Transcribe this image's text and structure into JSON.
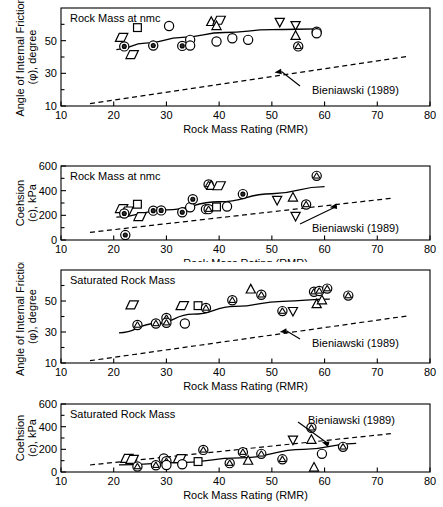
{
  "figure": {
    "width": 443,
    "height": 507,
    "background": "#ffffff",
    "ink": "#000000"
  },
  "common": {
    "xlabel": "Rock Mass Rating (RMR)",
    "xticks": [
      10,
      20,
      30,
      40,
      50,
      60,
      70,
      80
    ],
    "xlim": [
      10,
      80
    ],
    "reference_label": "Bieniawski (1989)"
  },
  "panels": [
    {
      "id": "panel-a",
      "title": "Rock Mass at nmc",
      "ylabel_line1": "Angle of Internal Friction",
      "ylabel_line2": "(φ), degree",
      "yticklabels": [
        "10",
        "30",
        "50"
      ],
      "ylim": [
        10,
        70
      ],
      "ymajor": [
        10,
        30,
        50
      ],
      "yminor": [
        20,
        40,
        60
      ]
    },
    {
      "id": "panel-b",
      "title": "Rock Mass at nmc",
      "ylabel_line1": "Coehsion",
      "ylabel_line2": "(c), kPa",
      "yticklabels": [
        "0",
        "200",
        "400",
        "600"
      ],
      "ylim": [
        0,
        600
      ],
      "ymajor": [
        0,
        200,
        400,
        600
      ],
      "yminor": [
        100,
        300,
        500
      ]
    },
    {
      "id": "panel-c",
      "title": "Saturated Rock Mass",
      "ylabel_line1": "Angle of Internal Friction",
      "ylabel_line2": "(φ), degree",
      "yticklabels": [
        "10",
        "30",
        "50"
      ],
      "ylim": [
        10,
        70
      ],
      "ymajor": [
        10,
        30,
        50
      ],
      "yminor": [
        20,
        40,
        60
      ]
    },
    {
      "id": "panel-d",
      "title": "Saturated Rock Mass",
      "ylabel_line1": "Coehsion",
      "ylabel_line2": "(c), kPa",
      "yticklabels": [
        "0",
        "200",
        "400",
        "600"
      ],
      "ylim": [
        0,
        600
      ],
      "ymajor": [
        0,
        200,
        400,
        600
      ],
      "yminor": [
        100,
        300,
        500
      ]
    }
  ],
  "chart_data": [
    {
      "type": "scatter",
      "id": "panel-a",
      "title": "Rock Mass at nmc",
      "xlabel": "Rock Mass Rating (RMR)",
      "ylabel": "Angle of Internal Friction (φ), degree",
      "xlim": [
        10,
        80
      ],
      "ylim": [
        10,
        70
      ],
      "grid": false,
      "legend": "none",
      "points": [
        {
          "x": 21.5,
          "y": 52.0,
          "marker": "parallelogram"
        },
        {
          "x": 22.0,
          "y": 46.5,
          "marker": "circle-dot"
        },
        {
          "x": 24.5,
          "y": 58.0,
          "marker": "square"
        },
        {
          "x": 23.5,
          "y": 41.5,
          "marker": "parallelogram"
        },
        {
          "x": 27.5,
          "y": 47.0,
          "marker": "circle-dot"
        },
        {
          "x": 30.5,
          "y": 59.0,
          "marker": "circle"
        },
        {
          "x": 33.0,
          "y": 46.8,
          "marker": "circle-dot"
        },
        {
          "x": 34.5,
          "y": 50.5,
          "marker": "circle"
        },
        {
          "x": 34.5,
          "y": 47.0,
          "marker": "circle"
        },
        {
          "x": 38.5,
          "y": 61.5,
          "marker": "triangle-up"
        },
        {
          "x": 40.0,
          "y": 62.5,
          "marker": "parallelogram"
        },
        {
          "x": 39.5,
          "y": 59.0,
          "marker": "triangle-up"
        },
        {
          "x": 39.5,
          "y": 49.5,
          "marker": "circle"
        },
        {
          "x": 42.5,
          "y": 51.5,
          "marker": "circle"
        },
        {
          "x": 45.5,
          "y": 50.5,
          "marker": "circle"
        },
        {
          "x": 51.5,
          "y": 61.5,
          "marker": "triangle-down"
        },
        {
          "x": 54.5,
          "y": 59.5,
          "marker": "triangle-down"
        },
        {
          "x": 54.5,
          "y": 53.0,
          "marker": "triangle-up"
        },
        {
          "x": 55.0,
          "y": 46.5,
          "marker": "circle-hatch"
        },
        {
          "x": 58.5,
          "y": 55.5,
          "marker": "circle-hatch"
        },
        {
          "x": 58.5,
          "y": 54.5,
          "marker": "circle"
        }
      ],
      "fit_line": {
        "label": "rock mass fit",
        "style": "solid",
        "points": [
          [
            20.5,
            44.5
          ],
          [
            26,
            48.5
          ],
          [
            33,
            52
          ],
          [
            41,
            55
          ],
          [
            50,
            56.8
          ],
          [
            59,
            57.2
          ]
        ]
      },
      "reference_line": {
        "label": "Bieniawski (1989)",
        "style": "dashed",
        "points": [
          [
            15.5,
            11.5
          ],
          [
            76.0,
            40.5
          ]
        ]
      },
      "annotation": {
        "text": "Bieniawski (1989)",
        "arrow_target_x": 50.5,
        "arrow_target_y": 30.5
      }
    },
    {
      "type": "scatter",
      "id": "panel-b",
      "title": "Rock Mass at nmc",
      "xlabel": "Rock Mass Rating (RMR)",
      "ylabel": "Coehsion (c), kPa",
      "xlim": [
        10,
        80
      ],
      "ylim": [
        0,
        600
      ],
      "grid": false,
      "legend": "none",
      "points": [
        {
          "x": 21.5,
          "y": 255,
          "marker": "parallelogram"
        },
        {
          "x": 22.5,
          "y": 235,
          "marker": "parallelogram"
        },
        {
          "x": 22.0,
          "y": 215,
          "marker": "circle-dot"
        },
        {
          "x": 22.2,
          "y": 40,
          "marker": "circle-dot"
        },
        {
          "x": 24.5,
          "y": 290,
          "marker": "square"
        },
        {
          "x": 25.0,
          "y": 190,
          "marker": "parallelogram"
        },
        {
          "x": 27.5,
          "y": 238,
          "marker": "circle-dot"
        },
        {
          "x": 29.0,
          "y": 240,
          "marker": "circle-dot"
        },
        {
          "x": 33.0,
          "y": 225,
          "marker": "circle-dot"
        },
        {
          "x": 34.5,
          "y": 265,
          "marker": "circle"
        },
        {
          "x": 35.0,
          "y": 330,
          "marker": "circle-dot"
        },
        {
          "x": 37.5,
          "y": 250,
          "marker": "circle"
        },
        {
          "x": 38.0,
          "y": 450,
          "marker": "circle-hatch"
        },
        {
          "x": 38.5,
          "y": 440,
          "marker": "triangle-up"
        },
        {
          "x": 40.0,
          "y": 440,
          "marker": "parallelogram"
        },
        {
          "x": 38.0,
          "y": 250,
          "marker": "circle-hatch"
        },
        {
          "x": 39.5,
          "y": 268,
          "marker": "square"
        },
        {
          "x": 41.5,
          "y": 272,
          "marker": "circle"
        },
        {
          "x": 44.5,
          "y": 372,
          "marker": "circle-dot"
        },
        {
          "x": 51.0,
          "y": 325,
          "marker": "triangle-down"
        },
        {
          "x": 54.0,
          "y": 345,
          "marker": "triangle-up"
        },
        {
          "x": 54.5,
          "y": 195,
          "marker": "triangle-down"
        },
        {
          "x": 56.5,
          "y": 288,
          "marker": "circle-hatch"
        },
        {
          "x": 58.5,
          "y": 520,
          "marker": "circle-hatch"
        }
      ],
      "fit_line": {
        "label": "rock mass fit",
        "style": "solid",
        "points": [
          [
            20.5,
            185
          ],
          [
            30,
            245
          ],
          [
            40,
            310
          ],
          [
            50,
            375
          ],
          [
            60,
            432
          ]
        ]
      },
      "reference_line": {
        "label": "Bieniawski (1989)",
        "style": "dashed",
        "points": [
          [
            15.5,
            62
          ],
          [
            73.0,
            340
          ]
        ]
      },
      "annotation": {
        "text": "Bieniawski (1989)",
        "arrow_target_x": 61.0,
        "arrow_target_y": 265
      }
    },
    {
      "type": "scatter",
      "id": "panel-c",
      "title": "Saturated Rock Mass",
      "xlabel": "Rock Mass Rating (RMR)",
      "ylabel": "Angle of Internal Friction (φ), degree",
      "xlim": [
        10,
        80
      ],
      "ylim": [
        10,
        70
      ],
      "grid": false,
      "legend": "none",
      "points": [
        {
          "x": 23.5,
          "y": 47.5,
          "marker": "parallelogram"
        },
        {
          "x": 24.5,
          "y": 34.5,
          "marker": "circle-hatch"
        },
        {
          "x": 28.0,
          "y": 35.5,
          "marker": "circle-hatch"
        },
        {
          "x": 30.0,
          "y": 39.0,
          "marker": "circle-hatch"
        },
        {
          "x": 30.0,
          "y": 36.0,
          "marker": "circle-hatch"
        },
        {
          "x": 33.0,
          "y": 47.0,
          "marker": "parallelogram"
        },
        {
          "x": 33.5,
          "y": 35.5,
          "marker": "circle"
        },
        {
          "x": 36.0,
          "y": 47.0,
          "marker": "square"
        },
        {
          "x": 37.5,
          "y": 45.5,
          "marker": "circle-hatch"
        },
        {
          "x": 42.5,
          "y": 50.5,
          "marker": "circle-hatch"
        },
        {
          "x": 46.0,
          "y": 57.5,
          "marker": "triangle-up"
        },
        {
          "x": 48.0,
          "y": 54.0,
          "marker": "circle-hatch"
        },
        {
          "x": 52.0,
          "y": 43.5,
          "marker": "circle-hatch"
        },
        {
          "x": 54.0,
          "y": 43.5,
          "marker": "triangle-down"
        },
        {
          "x": 58.0,
          "y": 56.0,
          "marker": "circle-hatch"
        },
        {
          "x": 58.5,
          "y": 48.0,
          "marker": "triangle-up"
        },
        {
          "x": 59.0,
          "y": 56.5,
          "marker": "circle-hatch"
        },
        {
          "x": 59.5,
          "y": 50.5,
          "marker": "triangle-up"
        },
        {
          "x": 60.5,
          "y": 58.0,
          "marker": "circle-hatch"
        },
        {
          "x": 64.5,
          "y": 53.5,
          "marker": "circle-hatch"
        }
      ],
      "fit_line": {
        "label": "saturated fit",
        "style": "solid",
        "points": [
          [
            21.0,
            29.5
          ],
          [
            28,
            35.5
          ],
          [
            35,
            41.5
          ],
          [
            43,
            46.5
          ],
          [
            52,
            49.8
          ],
          [
            61,
            51.2
          ]
        ]
      },
      "reference_line": {
        "label": "Bieniawski (1989)",
        "style": "dashed",
        "points": [
          [
            15.5,
            11.5
          ],
          [
            76.0,
            40.5
          ]
        ]
      },
      "annotation": {
        "text": "Bieniawski (1989)",
        "arrow_target_x": 51.5,
        "arrow_target_y": 30.0
      }
    },
    {
      "type": "scatter",
      "id": "panel-d",
      "title": "Saturated Rock Mass",
      "xlabel": "Rock Mass Rating (RMR)",
      "ylabel": "Coehsion (c), kPa",
      "xlim": [
        10,
        80
      ],
      "ylim": [
        0,
        600
      ],
      "grid": false,
      "legend": "none",
      "points": [
        {
          "x": 22.5,
          "y": 120,
          "marker": "parallelogram"
        },
        {
          "x": 23.5,
          "y": 112,
          "marker": "parallelogram"
        },
        {
          "x": 24.5,
          "y": 48,
          "marker": "circle-hatch"
        },
        {
          "x": 28.0,
          "y": 60,
          "marker": "circle-hatch"
        },
        {
          "x": 29.5,
          "y": 120,
          "marker": "circle"
        },
        {
          "x": 30.0,
          "y": 95,
          "marker": "circle-hatch"
        },
        {
          "x": 30.0,
          "y": 62,
          "marker": "circle"
        },
        {
          "x": 32.5,
          "y": 118,
          "marker": "parallelogram"
        },
        {
          "x": 33.0,
          "y": 68,
          "marker": "circle"
        },
        {
          "x": 36.0,
          "y": 92,
          "marker": "square"
        },
        {
          "x": 37.0,
          "y": 195,
          "marker": "circle-hatch"
        },
        {
          "x": 42.0,
          "y": 78,
          "marker": "circle-hatch"
        },
        {
          "x": 44.5,
          "y": 175,
          "marker": "circle-hatch"
        },
        {
          "x": 45.5,
          "y": 100,
          "marker": "triangle-up"
        },
        {
          "x": 48.0,
          "y": 160,
          "marker": "circle-hatch"
        },
        {
          "x": 52.0,
          "y": 112,
          "marker": "circle-hatch"
        },
        {
          "x": 54.0,
          "y": 285,
          "marker": "triangle-down"
        },
        {
          "x": 57.5,
          "y": 390,
          "marker": "circle-hatch"
        },
        {
          "x": 57.5,
          "y": 285,
          "marker": "triangle-up"
        },
        {
          "x": 58.0,
          "y": 40,
          "marker": "triangle-up"
        },
        {
          "x": 59.5,
          "y": 160,
          "marker": "circle"
        },
        {
          "x": 63.5,
          "y": 222,
          "marker": "circle-hatch"
        }
      ],
      "fit_line": {
        "label": "saturated fit",
        "style": "solid",
        "points": [
          [
            21.0,
            62
          ],
          [
            32,
            82
          ],
          [
            44,
            125
          ],
          [
            56,
            200
          ],
          [
            66,
            252
          ]
        ]
      },
      "reference_line": {
        "label": "Bieniawski (1989)",
        "style": "dashed",
        "points": [
          [
            15.5,
            62
          ],
          [
            73.0,
            340
          ]
        ]
      },
      "annotation": {
        "text": "Bieniawski (1989)",
        "arrow_target_x": 59.5,
        "arrow_target_y": 262
      }
    }
  ]
}
